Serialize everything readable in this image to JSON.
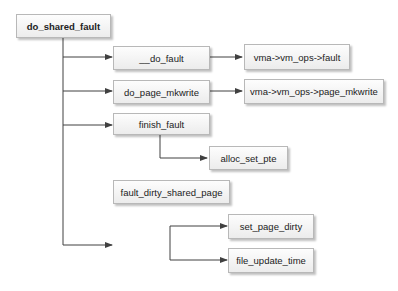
{
  "diagram": {
    "type": "call-graph",
    "nodes": {
      "root": {
        "label": "do_shared_fault"
      },
      "do_fault": {
        "label": "__do_fault"
      },
      "vm_fault": {
        "label": "vma->vm_ops->fault"
      },
      "do_page_mkwrite": {
        "label": "do_page_mkwrite"
      },
      "vm_page_mkwrite": {
        "label": "vma->vm_ops->page_mkwrite"
      },
      "finish_fault": {
        "label": "finish_fault"
      },
      "alloc_set_pte": {
        "label": "alloc_set_pte"
      },
      "fault_dirty_shared_page": {
        "label": "fault_dirty_shared_page"
      },
      "set_page_dirty": {
        "label": "set_page_dirty"
      },
      "file_update_time": {
        "label": "file_update_time"
      }
    },
    "edges": [
      [
        "do_shared_fault",
        "__do_fault"
      ],
      [
        "__do_fault",
        "vma->vm_ops->fault"
      ],
      [
        "do_shared_fault",
        "do_page_mkwrite"
      ],
      [
        "do_page_mkwrite",
        "vma->vm_ops->page_mkwrite"
      ],
      [
        "do_shared_fault",
        "finish_fault"
      ],
      [
        "finish_fault",
        "alloc_set_pte"
      ],
      [
        "do_shared_fault",
        "fault_dirty_shared_page"
      ],
      [
        "fault_dirty_shared_page",
        "set_page_dirty"
      ],
      [
        "fault_dirty_shared_page",
        "file_update_time"
      ]
    ],
    "colors": {
      "line": "#404040",
      "box_border": "#b8b8b8",
      "box_fill": "#f2f2f2"
    }
  }
}
